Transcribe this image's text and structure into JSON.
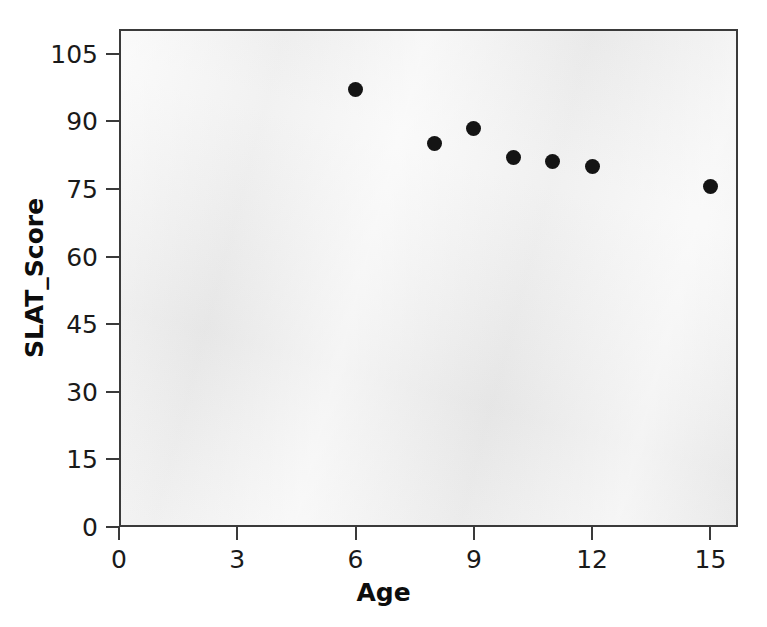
{
  "chart_data": {
    "type": "scatter",
    "title": "",
    "xlabel": "Age",
    "ylabel": "SLAT_Score",
    "xlim": [
      0,
      15.7
    ],
    "ylim": [
      0,
      110.5
    ],
    "xticks": [
      0,
      3,
      6,
      9,
      12,
      15
    ],
    "xtick_labels": [
      "0",
      "3",
      "6",
      "9",
      "12",
      "15"
    ],
    "yticks": [
      0,
      15,
      30,
      45,
      60,
      75,
      90,
      105
    ],
    "ytick_labels": [
      "0",
      "15",
      "30",
      "45",
      "60",
      "75",
      "90",
      "105"
    ],
    "grid": false,
    "legend": false,
    "panel_background": "#efefef",
    "panel_border": "#3a3a3a",
    "marker_color": "#141414",
    "marker_shape": "circle",
    "series": [
      {
        "name": "SLAT_Score",
        "points": [
          {
            "x": 6,
            "y": 97
          },
          {
            "x": 8,
            "y": 85
          },
          {
            "x": 9,
            "y": 88.5
          },
          {
            "x": 10,
            "y": 82
          },
          {
            "x": 11,
            "y": 81
          },
          {
            "x": 12,
            "y": 80
          },
          {
            "x": 15,
            "y": 75.5
          }
        ]
      }
    ]
  }
}
